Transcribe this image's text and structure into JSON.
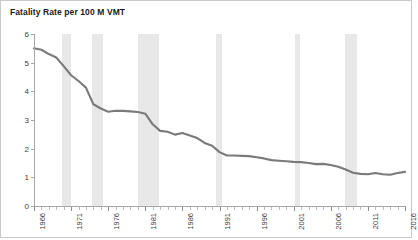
{
  "chart": {
    "title": "Fatality Rate per 100 M VMT",
    "line_color": "#7a7a7a",
    "band_color": "#e8e8e8",
    "axis_color": "#a6a6a6",
    "border_color": "#c9c9c9"
  },
  "chart_data": {
    "type": "line",
    "title": "Fatality Rate per 100 M VMT",
    "xlabel": "",
    "ylabel": "",
    "xlim": [
      1966,
      2016
    ],
    "ylim": [
      0,
      6
    ],
    "grid": false,
    "legend": "none",
    "y_ticks": [
      0,
      1,
      2,
      3,
      4,
      5,
      6
    ],
    "x_tick_labels": [
      "1966",
      "1971",
      "1976",
      "1981",
      "1986",
      "1991",
      "1996",
      "2001",
      "2006",
      "2011",
      "2016"
    ],
    "x_tick_years": [
      1966,
      1971,
      1976,
      1981,
      1986,
      1991,
      1996,
      2001,
      2006,
      2011,
      2016
    ],
    "x": [
      1966,
      1967,
      1968,
      1969,
      1970,
      1971,
      1972,
      1973,
      1974,
      1975,
      1976,
      1977,
      1978,
      1979,
      1980,
      1981,
      1982,
      1983,
      1984,
      1985,
      1986,
      1987,
      1988,
      1989,
      1990,
      1991,
      1992,
      1993,
      1994,
      1995,
      1996,
      1997,
      1998,
      1999,
      2000,
      2001,
      2002,
      2003,
      2004,
      2005,
      2006,
      2007,
      2008,
      2009,
      2010,
      2011,
      2012,
      2013,
      2014,
      2015,
      2016
    ],
    "values": [
      5.5,
      5.45,
      5.3,
      5.18,
      4.88,
      4.56,
      4.36,
      4.13,
      3.55,
      3.4,
      3.29,
      3.32,
      3.32,
      3.3,
      3.28,
      3.22,
      2.85,
      2.62,
      2.59,
      2.49,
      2.55,
      2.46,
      2.37,
      2.2,
      2.1,
      1.88,
      1.76,
      1.76,
      1.75,
      1.74,
      1.7,
      1.66,
      1.6,
      1.58,
      1.56,
      1.54,
      1.53,
      1.5,
      1.46,
      1.47,
      1.43,
      1.37,
      1.27,
      1.16,
      1.12,
      1.11,
      1.15,
      1.11,
      1.09,
      1.15,
      1.19
    ],
    "annotations": [
      {
        "type": "recession-band",
        "start": 1969.8,
        "end": 1971.0
      },
      {
        "type": "recession-band",
        "start": 1973.8,
        "end": 1975.3
      },
      {
        "type": "recession-band",
        "start": 1980.0,
        "end": 1982.9
      },
      {
        "type": "recession-band",
        "start": 1990.5,
        "end": 1991.3
      },
      {
        "type": "recession-band",
        "start": 2001.2,
        "end": 2001.9
      },
      {
        "type": "recession-band",
        "start": 2007.9,
        "end": 2009.5
      }
    ]
  }
}
